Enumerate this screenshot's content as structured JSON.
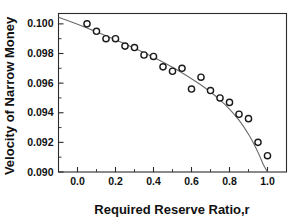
{
  "chart_data": {
    "type": "scatter",
    "title": "",
    "xlabel": "Required Reserve Ratio,r",
    "ylabel": "Velocity of Narrow Money",
    "xlim": [
      -0.1,
      1.1
    ],
    "ylim": [
      0.09,
      0.1007
    ],
    "grid": false,
    "legend": null,
    "x_ticks": [
      0.0,
      0.2,
      0.4,
      0.6,
      0.8,
      1.0
    ],
    "x_tick_labels": [
      "0.0",
      "0.2",
      "0.4",
      "0.6",
      "0.8",
      "1.0"
    ],
    "x_minor_ticks": [
      -0.1,
      0.1,
      0.3,
      0.5,
      0.7,
      0.9,
      1.1
    ],
    "y_ticks": [
      0.09,
      0.092,
      0.094,
      0.096,
      0.098,
      0.1
    ],
    "y_tick_labels": [
      "0.090",
      "0.092",
      "0.094",
      "0.096",
      "0.098",
      "0.100"
    ],
    "y_minor_ticks": [
      0.091,
      0.093,
      0.095,
      0.097,
      0.099
    ],
    "x": [
      0.05,
      0.1,
      0.15,
      0.2,
      0.25,
      0.3,
      0.35,
      0.4,
      0.45,
      0.5,
      0.55,
      0.6,
      0.65,
      0.7,
      0.75,
      0.8,
      0.85,
      0.9,
      0.95,
      1.0
    ],
    "y": [
      0.1,
      0.0995,
      0.099,
      0.099,
      0.0985,
      0.0984,
      0.0979,
      0.0978,
      0.0971,
      0.0968,
      0.097,
      0.0956,
      0.0964,
      0.0955,
      0.095,
      0.0947,
      0.0939,
      0.0936,
      0.092,
      0.0911
    ],
    "series": [
      {
        "name": "Velocity of Narrow Money",
        "marker": "open-circle",
        "marker_color": "#1a1a1a",
        "values": [
          0.1,
          0.0995,
          0.099,
          0.099,
          0.0985,
          0.0984,
          0.0979,
          0.0978,
          0.0971,
          0.0968,
          0.097,
          0.0956,
          0.0964,
          0.0955,
          0.095,
          0.0947,
          0.0939,
          0.0936,
          0.092,
          0.0911
        ]
      },
      {
        "name": "fitted-curve",
        "type": "line",
        "line_color": "#6b6b6b",
        "x": [
          -0.1,
          0.0,
          0.1,
          0.2,
          0.3,
          0.4,
          0.5,
          0.6,
          0.65,
          0.7,
          0.75,
          0.8,
          0.85,
          0.9,
          0.93,
          0.96,
          0.98,
          1.0
        ],
        "values": [
          0.10045,
          0.09997,
          0.09946,
          0.09893,
          0.09836,
          0.09775,
          0.09707,
          0.0963,
          0.09587,
          0.0954,
          0.09487,
          0.09425,
          0.0935,
          0.09255,
          0.09186,
          0.09105,
          0.09045,
          0.09
        ]
      }
    ],
    "colors": {
      "marker_edge": "#1a1a1a",
      "marker_fill": "#ffffff",
      "curve": "#6b6b6b",
      "frame": "#2b2b2b",
      "background": "#ffffff",
      "text": "#111111"
    }
  },
  "axes": {
    "x_title": "Required Reserve Ratio,r",
    "y_title": "Velocity of Narrow Money",
    "x_labels": [
      "0.0",
      "0.2",
      "0.4",
      "0.6",
      "0.8",
      "1.0"
    ],
    "y_labels": [
      "0.090",
      "0.092",
      "0.094",
      "0.096",
      "0.098",
      "0.100"
    ]
  }
}
